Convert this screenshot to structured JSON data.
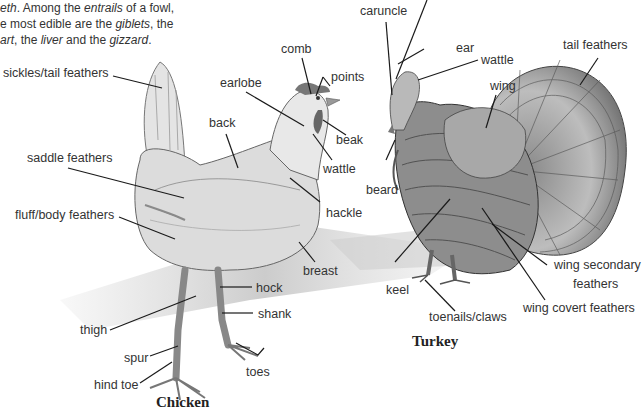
{
  "intro_text": {
    "line1": {
      "a": "eth",
      "b": ". Among the ",
      "c": "entrails",
      "d": " of a fowl,"
    },
    "line2": {
      "a": "e most edible are the ",
      "b": "giblets",
      "c": ", the"
    },
    "line3": {
      "a": "art",
      "b": ", the ",
      "c": "liver",
      "d": " and the ",
      "e": "gizzard",
      "f": "."
    }
  },
  "chicken": {
    "title": "Chicken",
    "labels": {
      "sickles": "sickles/tail feathers",
      "comb": "comb",
      "points": "points",
      "earlobe": "earlobe",
      "back": "back",
      "beak": "beak",
      "wattle": "wattle",
      "saddle": "saddle feathers",
      "fluff": "fluff/body feathers",
      "hackle": "hackle",
      "breast": "breast",
      "hock": "hock",
      "shank": "shank",
      "thigh": "thigh",
      "spur": "spur",
      "toes": "toes",
      "hind_toe": "hind toe"
    }
  },
  "turkey": {
    "title": "Turkey",
    "labels": {
      "caruncle": "caruncle",
      "ear": "ear",
      "wattle": "wattle",
      "tail_feathers": "tail feathers",
      "wing": "wing",
      "beard": "beard",
      "keel": "keel",
      "wing_secondary": "wing secondary",
      "wing_secondary_2": "feathers",
      "wing_covert": "wing covert feathers",
      "toenails": "toenails/claws"
    }
  }
}
